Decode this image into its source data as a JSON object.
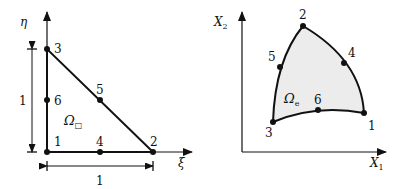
{
  "left_diagram": {
    "title": "reference triangle",
    "axis_x_label": "ξ",
    "axis_y_label": "η",
    "domain_label": "Ω",
    "domain_subscript": "□",
    "nodes": [
      {
        "id": "1",
        "label": "1"
      },
      {
        "id": "2",
        "label": "2"
      },
      {
        "id": "3",
        "label": "3"
      },
      {
        "id": "4",
        "label": "4"
      },
      {
        "id": "5",
        "label": "5"
      },
      {
        "id": "6",
        "label": "6"
      }
    ],
    "dim_horizontal": "1",
    "dim_vertical": "1"
  },
  "right_diagram": {
    "title": "curved element",
    "axis_x_label": "X",
    "axis_x_sub": "1",
    "axis_y_label": "X",
    "axis_y_sub": "2",
    "domain_label": "Ω",
    "domain_subscript": "e",
    "nodes": [
      {
        "id": "1",
        "label": "1"
      },
      {
        "id": "2",
        "label": "2"
      },
      {
        "id": "3",
        "label": "3"
      },
      {
        "id": "4",
        "label": "4"
      },
      {
        "id": "5",
        "label": "5"
      },
      {
        "id": "6",
        "label": "6"
      }
    ]
  },
  "colors": {
    "stroke": "#111111",
    "fill_element": "#ececec"
  }
}
